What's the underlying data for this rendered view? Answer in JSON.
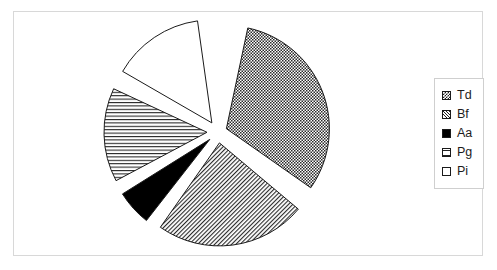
{
  "chart_data": {
    "type": "pie",
    "title": "",
    "exploded": true,
    "legend_position": "right",
    "categories": [
      "Td",
      "Bf",
      "Aa",
      "Pg",
      "Pi"
    ],
    "values": [
      31.4,
      23.6,
      5.6,
      14.7,
      14.2
    ],
    "series": [
      {
        "name": "Share",
        "values": [
          31.4,
          23.6,
          5.6,
          14.7,
          14.2
        ]
      }
    ],
    "slices": [
      {
        "label": "Td",
        "value": 31.4,
        "start_angle": 12,
        "end_angle": 125,
        "fill": "checkerboard",
        "explode": 9
      },
      {
        "label": "Bf",
        "value": 23.6,
        "start_angle": 130,
        "end_angle": 215,
        "fill": "diagonal",
        "explode": 11
      },
      {
        "label": "Aa",
        "value": 5.6,
        "start_angle": 218,
        "end_angle": 238,
        "fill": "solid-black",
        "explode": 11
      },
      {
        "label": "Pg",
        "value": 14.7,
        "start_angle": 242,
        "end_angle": 295,
        "fill": "horizontal",
        "explode": 11
      },
      {
        "label": "Pi",
        "value": 14.2,
        "start_angle": 300,
        "end_angle": 352,
        "fill": "none",
        "explode": 11
      }
    ],
    "geometry": {
      "center_x": 218,
      "center_y": 132,
      "radius": 103
    },
    "colors": {
      "outline": "#1a1a1a",
      "pattern": "#222222",
      "background": "#ffffff",
      "frame": "#d8d8d8",
      "legend_border": "#cfcfcf"
    }
  },
  "legend": {
    "items": [
      {
        "label": "Td",
        "swatch": "checkerboard-swatch"
      },
      {
        "label": "Bf",
        "swatch": "diagonal-swatch"
      },
      {
        "label": "Aa",
        "swatch": "solid-black-swatch"
      },
      {
        "label": "Pg",
        "swatch": "horizontal-lines-swatch"
      },
      {
        "label": "Pi",
        "swatch": "blank-swatch"
      }
    ]
  }
}
